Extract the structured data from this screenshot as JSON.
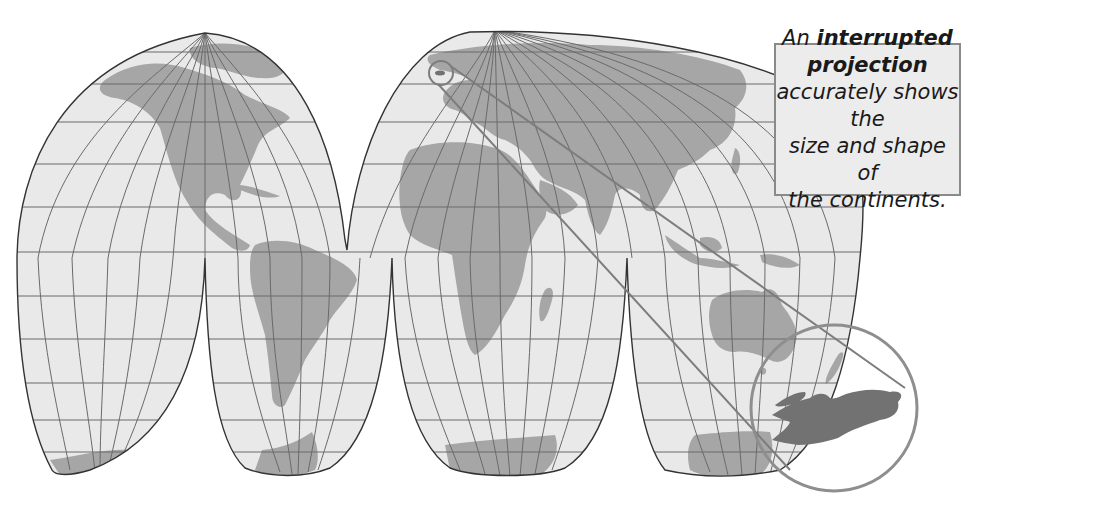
{
  "figure": {
    "projection": "Goode homolosine (interrupted)",
    "colors": {
      "ocean": "#e9e9e9",
      "land": "#a6a6a6",
      "graticule": "#6a6a6a",
      "outline": "#333333",
      "highlight_land": "#727272",
      "callout_bg": "#ececec",
      "callout_border": "#8a8a8a",
      "zoom_circle": "#8e8e8e"
    }
  },
  "callout": {
    "line1_pre": "An ",
    "line1_bold": "interrupted projection",
    "line2": "accurately shows the",
    "line3": "size and shape of",
    "line4": "the continents."
  },
  "inset": {
    "description": "Magnified view of a small region (Great Britain) highlighted with a circle in northern Europe",
    "small_circle_label": "source-region",
    "large_circle_label": "magnified-region"
  }
}
